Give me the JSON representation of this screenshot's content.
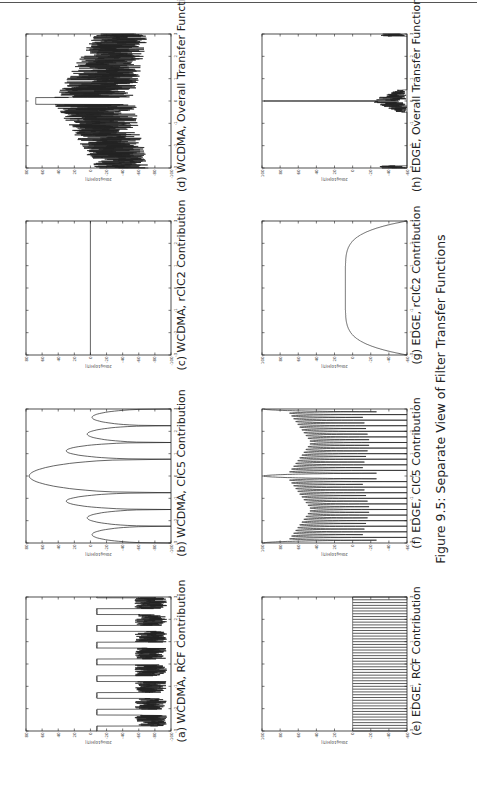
{
  "figure": {
    "caption": "Figure 9.5: Separate View of Filter Transfer Functions"
  },
  "panels": [
    {
      "id": "a",
      "caption": "(a) WCDMA, RCF Contribution"
    },
    {
      "id": "b",
      "caption": "(b) WCDMA, CIC5 Contribution"
    },
    {
      "id": "c",
      "caption": "(c) WCDMA, rCIC2 Contribution"
    },
    {
      "id": "d",
      "caption": "(d) WCDMA, Overall Transfer Function"
    },
    {
      "id": "e",
      "caption": "(e) EDGE, RCF Contribution"
    },
    {
      "id": "f",
      "caption": "(f) EDGE, CIC5 Contribution"
    },
    {
      "id": "g",
      "caption": "(g) EDGE, rCIC2 Contribution"
    },
    {
      "id": "h",
      "caption": "(h) EDGE, Overall Transfer Function"
    }
  ],
  "chart_data": [
    {
      "id": "a",
      "type": "line",
      "title": "(a) WCDMA, RCF Contribution",
      "xlabel": "f",
      "ylabel": "20log10|H(f)|",
      "xlim": [
        -3,
        3
      ],
      "ylim": [
        -100,
        80
      ],
      "xticks": [
        -3,
        -2,
        -1,
        0,
        1,
        2,
        3
      ],
      "yticks": [
        80,
        60,
        40,
        20,
        0,
        -20,
        -40,
        -60,
        -80,
        -100
      ],
      "grid": false,
      "pattern": "periodic_passband",
      "passband_level": -8,
      "stopband_range": [
        -95,
        -55
      ],
      "periods": 8
    },
    {
      "id": "b",
      "type": "line",
      "title": "(b) WCDMA, CIC5 Contribution",
      "xlabel": "f",
      "ylabel": "20log10|H(f)|",
      "xlim": [
        -3,
        3
      ],
      "ylim": [
        -100,
        80
      ],
      "xticks": [
        -3,
        -2,
        -1,
        0,
        1,
        2,
        3
      ],
      "yticks": [
        80,
        60,
        40,
        20,
        0,
        -20,
        -40,
        -60,
        -80,
        -100
      ],
      "grid": false,
      "lobes": [
        {
          "x0": -3.0,
          "x1": -2.25,
          "peak": -2
        },
        {
          "x0": -2.25,
          "x1": -1.5,
          "peak": 4
        },
        {
          "x0": -1.5,
          "x1": -0.75,
          "peak": 30
        },
        {
          "x0": -0.75,
          "x1": 0.75,
          "peak": 76
        },
        {
          "x0": 0.75,
          "x1": 1.5,
          "peak": 30
        },
        {
          "x0": 1.5,
          "x1": 2.25,
          "peak": 4
        },
        {
          "x0": 2.25,
          "x1": 3.0,
          "peak": -2
        }
      ]
    },
    {
      "id": "c",
      "type": "line",
      "title": "(c) WCDMA, rCIC2 Contribution",
      "xlabel": "f",
      "ylabel": "20log10|H(f)|",
      "xlim": [
        -3,
        3
      ],
      "ylim": [
        -100,
        80
      ],
      "xticks": [
        -3,
        -2,
        -1,
        0,
        1,
        2,
        3
      ],
      "yticks": [
        80,
        60,
        40,
        20,
        0,
        -20,
        -40,
        -60,
        -80,
        -100
      ],
      "grid": false,
      "x": [
        -3,
        3
      ],
      "y": [
        0,
        0
      ]
    },
    {
      "id": "d",
      "type": "line",
      "title": "(d) WCDMA, Overall Transfer Function",
      "xlabel": "f",
      "ylabel": "20log10|H(f)|",
      "xlim": [
        -3,
        3
      ],
      "ylim": [
        -100,
        80
      ],
      "xticks": [
        -3,
        -2,
        -1,
        0,
        1,
        2,
        3
      ],
      "yticks": [
        80,
        60,
        40,
        20,
        0,
        -20,
        -40,
        -60,
        -80,
        -100
      ],
      "grid": false,
      "pattern": "overall",
      "passband_level": 68,
      "passband_halfwidth": 0.15
    },
    {
      "id": "e",
      "type": "line",
      "title": "(e) EDGE, RCF Contribution",
      "xlabel": "f",
      "ylabel": "20log10|H(f)|",
      "xlim": [
        -3,
        3
      ],
      "ylim": [
        -60,
        100
      ],
      "xticks": [
        -3,
        -2,
        -1,
        0,
        1,
        2,
        3
      ],
      "yticks": [
        100,
        80,
        60,
        40,
        20,
        0,
        -20,
        -40,
        -60
      ],
      "grid": false,
      "pattern": "comb",
      "top": 0,
      "bottom": -60,
      "teeth": 48
    },
    {
      "id": "f",
      "type": "line",
      "title": "(f) EDGE, CIC5 Contribution",
      "xlabel": "f",
      "ylabel": "20log10|H(f)|",
      "xlim": [
        -3,
        3
      ],
      "ylim": [
        -60,
        100
      ],
      "xticks": [
        -3,
        -2,
        -1,
        0,
        1,
        2,
        3
      ],
      "yticks": [
        100,
        80,
        60,
        40,
        20,
        0,
        -20,
        -40,
        -60
      ],
      "grid": false,
      "pattern": "cic_periodic",
      "main_peak": 98,
      "lobes_per_half": 24
    },
    {
      "id": "g",
      "type": "line",
      "title": "(g) EDGE, rCIC2 Contribution",
      "xlabel": "f",
      "ylabel": "20log10|H(f)|",
      "xlim": [
        -3,
        3
      ],
      "ylim": [
        -60,
        100
      ],
      "xticks": [
        -3,
        -2,
        -1,
        0,
        1,
        2,
        3
      ],
      "yticks": [
        100,
        80,
        60,
        40,
        20,
        0,
        -20,
        -40,
        -60
      ],
      "grid": false,
      "pattern": "bowl",
      "center_level": 8,
      "edge_level": -60
    },
    {
      "id": "h",
      "type": "line",
      "title": "(h) EDGE, Overall Transfer Function",
      "xlabel": "f",
      "ylabel": "20log10|H(f)|",
      "xlim": [
        -3,
        3
      ],
      "ylim": [
        -60,
        100
      ],
      "xticks": [
        -3,
        -2,
        -1,
        0,
        1,
        2,
        3
      ],
      "yticks": [
        100,
        80,
        60,
        40,
        20,
        0,
        -20,
        -40,
        -60
      ],
      "grid": false,
      "pattern": "spike",
      "peak": 98,
      "peak_halfwidth": 0.02
    }
  ]
}
